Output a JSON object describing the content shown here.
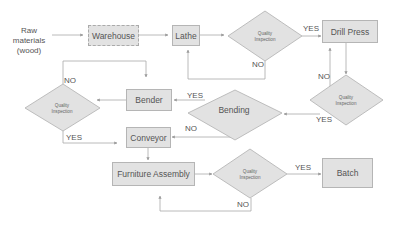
{
  "diagram": {
    "type": "flowchart",
    "start_text": "Raw\nmaterials\n(wood)",
    "nodes": {
      "warehouse": "Warehouse",
      "lathe": "Lathe",
      "drill_press": "Drill Press",
      "bender": "Bender",
      "conveyor": "Conveyor",
      "furniture_assembly": "Furniture Assembly",
      "batch": "Batch"
    },
    "decisions": {
      "qi_lathe": "Quality\nInspection",
      "qi_drill": "Quality\nInspection",
      "bending": "Bending",
      "qi_bender": "Quality\nInspection",
      "qi_assembly": "Quality\nInspection"
    },
    "edge_labels": {
      "qi_lathe_yes": "YES",
      "qi_lathe_no": "NO",
      "qi_drill_no": "NO",
      "qi_drill_yes": "YES",
      "bending_yes": "YES",
      "bending_no": "NO",
      "qi_bender_no": "NO",
      "qi_bender_yes": "YES",
      "qi_assembly_yes": "YES",
      "qi_assembly_no": "NO"
    },
    "colors": {
      "fill": "#e2e2e2",
      "border": "#b5b5b5",
      "line": "#a8a8a8",
      "text": "#555555"
    }
  }
}
